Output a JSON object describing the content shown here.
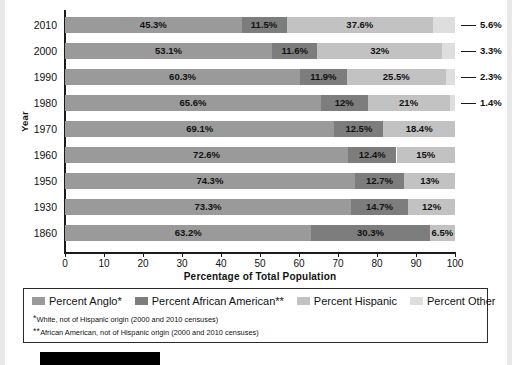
{
  "chart_data": {
    "type": "bar",
    "title": "",
    "subtitle": "",
    "orientation": "horizontal",
    "stacked": true,
    "xlabel": "Percentage of Total Population",
    "ylabel": "Year",
    "xlim": [
      0,
      100
    ],
    "xticks": [
      0,
      10,
      20,
      30,
      40,
      50,
      60,
      70,
      80,
      90,
      100
    ],
    "grid": false,
    "legend_position": "bottom",
    "categories": [
      "2010",
      "2000",
      "1990",
      "1980",
      "1970",
      "1960",
      "1950",
      "1930",
      "1860"
    ],
    "series": [
      {
        "name": "Percent Anglo*",
        "color": "#9a9a9a",
        "values": [
          45.3,
          53.1,
          60.3,
          65.6,
          69.1,
          72.6,
          74.3,
          73.3,
          63.2
        ]
      },
      {
        "name": "Percent African American**",
        "color": "#7d7d7d",
        "values": [
          11.5,
          11.6,
          11.9,
          12.0,
          12.5,
          12.4,
          12.7,
          14.7,
          30.3
        ]
      },
      {
        "name": "Percent Hispanic",
        "color": "#c2c2c2",
        "values": [
          37.6,
          32.0,
          25.5,
          21.0,
          18.4,
          15.0,
          13.0,
          12.0,
          6.5
        ]
      },
      {
        "name": "Percent Other",
        "color": "#dedede",
        "values": [
          5.6,
          3.3,
          2.3,
          1.4,
          null,
          null,
          null,
          null,
          null
        ]
      }
    ],
    "rows": [
      {
        "year": "2010",
        "segments": [
          {
            "series": "Percent Anglo*",
            "value": 45.3,
            "label": "45.3%",
            "label_position": "inside"
          },
          {
            "series": "Percent African American**",
            "value": 11.5,
            "label": "11.5%",
            "label_position": "inside"
          },
          {
            "series": "Percent Hispanic",
            "value": 37.6,
            "label": "37.6%",
            "label_position": "inside"
          },
          {
            "series": "Percent Other",
            "value": 5.6,
            "label": "5.6%",
            "label_position": "callout"
          }
        ]
      },
      {
        "year": "2000",
        "segments": [
          {
            "series": "Percent Anglo*",
            "value": 53.1,
            "label": "53.1%",
            "label_position": "inside"
          },
          {
            "series": "Percent African American**",
            "value": 11.6,
            "label": "11.6%",
            "label_position": "inside"
          },
          {
            "series": "Percent Hispanic",
            "value": 32.0,
            "label": "32%",
            "label_position": "inside"
          },
          {
            "series": "Percent Other",
            "value": 3.3,
            "label": "3.3%",
            "label_position": "callout"
          }
        ]
      },
      {
        "year": "1990",
        "segments": [
          {
            "series": "Percent Anglo*",
            "value": 60.3,
            "label": "60.3%",
            "label_position": "inside"
          },
          {
            "series": "Percent African American**",
            "value": 11.9,
            "label": "11.9%",
            "label_position": "inside"
          },
          {
            "series": "Percent Hispanic",
            "value": 25.5,
            "label": "25.5%",
            "label_position": "inside"
          },
          {
            "series": "Percent Other",
            "value": 2.3,
            "label": "2.3%",
            "label_position": "callout"
          }
        ]
      },
      {
        "year": "1980",
        "segments": [
          {
            "series": "Percent Anglo*",
            "value": 65.6,
            "label": "65.6%",
            "label_position": "inside"
          },
          {
            "series": "Percent African American**",
            "value": 12.0,
            "label": "12%",
            "label_position": "inside"
          },
          {
            "series": "Percent Hispanic",
            "value": 21.0,
            "label": "21%",
            "label_position": "inside"
          },
          {
            "series": "Percent Other",
            "value": 1.4,
            "label": "1.4%",
            "label_position": "callout"
          }
        ]
      },
      {
        "year": "1970",
        "segments": [
          {
            "series": "Percent Anglo*",
            "value": 69.1,
            "label": "69.1%",
            "label_position": "inside"
          },
          {
            "series": "Percent African American**",
            "value": 12.5,
            "label": "12.5%",
            "label_position": "inside"
          },
          {
            "series": "Percent Hispanic",
            "value": 18.4,
            "label": "18.4%",
            "label_position": "inside"
          }
        ]
      },
      {
        "year": "1960",
        "segments": [
          {
            "series": "Percent Anglo*",
            "value": 72.6,
            "label": "72.6%",
            "label_position": "inside"
          },
          {
            "series": "Percent African American**",
            "value": 12.4,
            "label": "12.4%",
            "label_position": "inside"
          },
          {
            "series": "Percent Hispanic",
            "value": 15.0,
            "label": "15%",
            "label_position": "inside"
          }
        ]
      },
      {
        "year": "1950",
        "segments": [
          {
            "series": "Percent Anglo*",
            "value": 74.3,
            "label": "74.3%",
            "label_position": "inside"
          },
          {
            "series": "Percent African American**",
            "value": 12.7,
            "label": "12.7%",
            "label_position": "inside"
          },
          {
            "series": "Percent Hispanic",
            "value": 13.0,
            "label": "13%",
            "label_position": "inside"
          }
        ]
      },
      {
        "year": "1930",
        "segments": [
          {
            "series": "Percent Anglo*",
            "value": 73.3,
            "label": "73.3%",
            "label_position": "inside"
          },
          {
            "series": "Percent African American**",
            "value": 14.7,
            "label": "14.7%",
            "label_position": "inside"
          },
          {
            "series": "Percent Hispanic",
            "value": 12.0,
            "label": "12%",
            "label_position": "inside"
          }
        ]
      },
      {
        "year": "1860",
        "segments": [
          {
            "series": "Percent Anglo*",
            "value": 63.2,
            "label": "63.2%",
            "label_position": "inside"
          },
          {
            "series": "Percent African American**",
            "value": 30.3,
            "label": "30.3%",
            "label_position": "inside"
          },
          {
            "series": "Percent Hispanic",
            "value": 6.5,
            "label": "6.5%",
            "label_position": "inside"
          }
        ]
      }
    ]
  },
  "legend": {
    "items": [
      {
        "label": "Percent Anglo*",
        "color": "#9a9a9a"
      },
      {
        "label": "Percent African American**",
        "color": "#7d7d7d"
      },
      {
        "label": "Percent Hispanic",
        "color": "#c2c2c2"
      },
      {
        "label": "Percent Other",
        "color": "#dedede"
      }
    ],
    "footnotes": [
      {
        "mark": "*",
        "text": "White, not of Hispanic origin (2000 and 2010 censuses)"
      },
      {
        "mark": "**",
        "text": "African American, not of Hispanic origin (2000 and 2010 censuses)"
      }
    ]
  }
}
